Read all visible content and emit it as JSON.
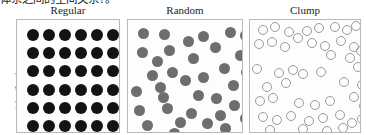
{
  "document": {
    "clipped_body_text": "体系之间的空间关系?。"
  },
  "figure": {
    "y_axis_label": "Distribution pattern",
    "columns": [
      {
        "id": "regular",
        "label": "Regular"
      },
      {
        "id": "random",
        "label": "Random"
      },
      {
        "id": "clump",
        "label": "Clump"
      }
    ]
  },
  "colors": {
    "dot_dark": "#131313",
    "dot_gray": "#6e6e6e",
    "dot_outline": "#9a9a9a",
    "panel_border": "#b9b9b9",
    "panel_background": "#fdfdfd",
    "text": "#1c1c1c"
  },
  "chart_data": {
    "type": "scatter",
    "title": "",
    "xlabel": "",
    "ylabel": "Distribution pattern",
    "grid": false,
    "legend": "none",
    "panels": [
      {
        "name": "Regular",
        "dot_style": "filled-dark",
        "dot_diameter": 12,
        "count": 36,
        "description": "Evenly spaced 6 by 6 lattice of dark filled circles",
        "points": [
          [
            10,
            9
          ],
          [
            26,
            9
          ],
          [
            42,
            9
          ],
          [
            58,
            9
          ],
          [
            74,
            9
          ],
          [
            90,
            9
          ],
          [
            10,
            27
          ],
          [
            26,
            27
          ],
          [
            42,
            27
          ],
          [
            58,
            27
          ],
          [
            74,
            27
          ],
          [
            90,
            27
          ],
          [
            10,
            45
          ],
          [
            26,
            45
          ],
          [
            42,
            45
          ],
          [
            58,
            45
          ],
          [
            74,
            45
          ],
          [
            90,
            45
          ],
          [
            10,
            64
          ],
          [
            26,
            64
          ],
          [
            42,
            64
          ],
          [
            58,
            64
          ],
          [
            74,
            64
          ],
          [
            90,
            64
          ],
          [
            10,
            82
          ],
          [
            26,
            82
          ],
          [
            42,
            82
          ],
          [
            58,
            82
          ],
          [
            74,
            82
          ],
          [
            90,
            82
          ],
          [
            10,
            100
          ],
          [
            26,
            100
          ],
          [
            42,
            100
          ],
          [
            58,
            100
          ],
          [
            74,
            100
          ],
          [
            90,
            100
          ]
        ]
      },
      {
        "name": "Random",
        "dot_style": "filled-gray",
        "dot_diameter": 11,
        "count": 36,
        "description": "Randomly positioned medium gray filled circles",
        "points": [
          [
            10,
            8
          ],
          [
            31,
            9
          ],
          [
            55,
            16
          ],
          [
            70,
            11
          ],
          [
            97,
            7
          ],
          [
            112,
            10
          ],
          [
            9,
            27
          ],
          [
            36,
            25
          ],
          [
            82,
            22
          ],
          [
            107,
            30
          ],
          [
            60,
            33
          ],
          [
            19,
            50
          ],
          [
            39,
            47
          ],
          [
            91,
            43
          ],
          [
            113,
            47
          ],
          [
            27,
            62
          ],
          [
            65,
            70
          ],
          [
            83,
            73
          ],
          [
            6,
            85
          ],
          [
            34,
            83
          ],
          [
            101,
            80
          ],
          [
            14,
            100
          ],
          [
            47,
            97
          ],
          [
            74,
            98
          ],
          [
            92,
            103
          ],
          [
            112,
            93
          ],
          [
            52,
            55
          ],
          [
            70,
            52
          ],
          [
            24,
            36
          ],
          [
            100,
            60
          ],
          [
            41,
            108
          ],
          [
            87,
            90
          ],
          [
            3,
            66
          ],
          [
            58,
            88
          ],
          [
            30,
            72
          ],
          [
            115,
            67
          ]
        ]
      },
      {
        "name": "Clump",
        "dot_style": "hollow",
        "dot_diameter": 10,
        "count": 46,
        "description": "Hollow outlined circles arranged in clusters with empty gaps",
        "points": [
          [
            8,
            5
          ],
          [
            20,
            2
          ],
          [
            34,
            7
          ],
          [
            52,
            6
          ],
          [
            64,
            3
          ],
          [
            80,
            2
          ],
          [
            92,
            5
          ],
          [
            101,
            1
          ],
          [
            4,
            19
          ],
          [
            17,
            17
          ],
          [
            30,
            22
          ],
          [
            57,
            18
          ],
          [
            70,
            21
          ],
          [
            86,
            16
          ],
          [
            99,
            22
          ],
          [
            43,
            13
          ],
          [
            76,
            30
          ],
          [
            95,
            33
          ],
          [
            106,
            26
          ],
          [
            2,
            44
          ],
          [
            24,
            48
          ],
          [
            38,
            45
          ],
          [
            48,
            49
          ],
          [
            66,
            47
          ],
          [
            103,
            42
          ],
          [
            31,
            58
          ],
          [
            12,
            62
          ],
          [
            89,
            57
          ],
          [
            107,
            60
          ],
          [
            5,
            76
          ],
          [
            18,
            73
          ],
          [
            44,
            78
          ],
          [
            60,
            80
          ],
          [
            75,
            76
          ],
          [
            99,
            72
          ],
          [
            109,
            81
          ],
          [
            8,
            92
          ],
          [
            22,
            95
          ],
          [
            36,
            91
          ],
          [
            54,
            96
          ],
          [
            68,
            93
          ],
          [
            85,
            90
          ],
          [
            97,
            98
          ],
          [
            107,
            94
          ],
          [
            15,
            105
          ],
          [
            48,
            104
          ],
          [
            72,
            106
          ],
          [
            88,
            103
          ]
        ]
      }
    ]
  }
}
